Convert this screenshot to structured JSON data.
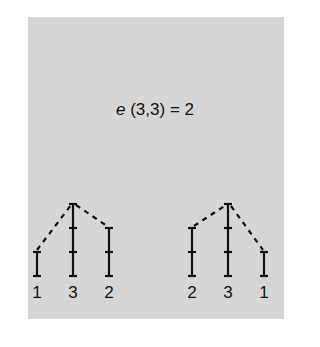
{
  "formula": {
    "variable": "e",
    "args": "(3,3)",
    "equals": "= 2",
    "full": "e (3,3) = 2"
  },
  "colors": {
    "background": "#ffffff",
    "panel": "#d6d6d6",
    "ink": "#111111"
  },
  "diagrams": [
    {
      "name": "left-tree",
      "labels": [
        "1",
        "3",
        "2"
      ],
      "heights": [
        1,
        3,
        2
      ]
    },
    {
      "name": "right-tree",
      "labels": [
        "2",
        "3",
        "1"
      ],
      "heights": [
        2,
        3,
        1
      ]
    }
  ]
}
